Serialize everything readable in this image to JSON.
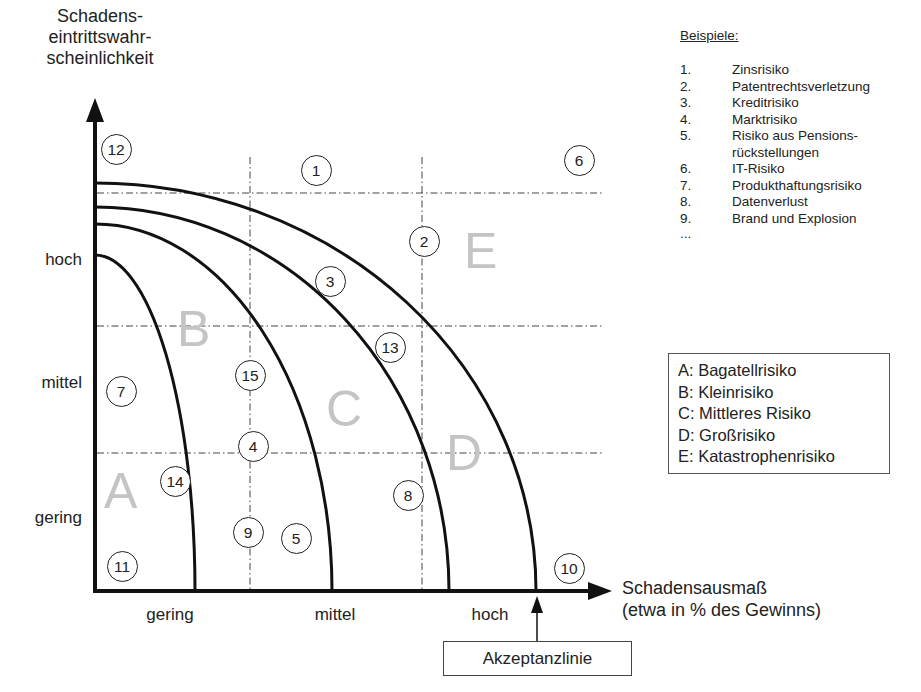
{
  "y_axis": {
    "title_lines": [
      "Schadens-",
      "eintrittswahr-",
      "scheinlichkeit"
    ],
    "ticks": [
      {
        "label": "hoch",
        "y": 260
      },
      {
        "label": "mittel",
        "y": 384
      },
      {
        "label": "gering",
        "y": 518
      }
    ]
  },
  "x_axis": {
    "title_lines": [
      "Schadensausmaß",
      "(etwa in % des Gewinns)"
    ],
    "ticks": [
      {
        "label": "gering",
        "x": 170
      },
      {
        "label": "mittel",
        "x": 335
      },
      {
        "label": "hoch",
        "x": 490
      }
    ]
  },
  "acceptance_line": {
    "label": "Akzeptanzlinie"
  },
  "examples": {
    "title": "Beispiele:",
    "items": [
      {
        "num": "1.",
        "label": "Zinsrisiko"
      },
      {
        "num": "2.",
        "label": "Patentrechtsverletzung"
      },
      {
        "num": "3.",
        "label": "Kreditrisiko"
      },
      {
        "num": "4.",
        "label": "Marktrisiko"
      },
      {
        "num": "5.",
        "label": "Risiko aus Pensions-"
      },
      {
        "num": "",
        "label": "rückstellungen"
      },
      {
        "num": "6.",
        "label": "IT-Risiko"
      },
      {
        "num": "7.",
        "label": "Produkthaftungsrisiko"
      },
      {
        "num": "8.",
        "label": "Datenverlust"
      },
      {
        "num": "9.",
        "label": "Brand und Explosion"
      }
    ],
    "ellipsis": "..."
  },
  "legend": {
    "items": [
      "A: Bagatellrisiko",
      "B: Kleinrisiko",
      "C: Mittleres Risiko",
      "D: Großrisiko",
      "E: Katastrophenrisiko"
    ]
  },
  "zones": [
    {
      "letter": "A",
      "x": 104,
      "y": 466
    },
    {
      "letter": "B",
      "x": 177,
      "y": 304
    },
    {
      "letter": "C",
      "x": 326,
      "y": 384
    },
    {
      "letter": "D",
      "x": 446,
      "y": 428
    },
    {
      "letter": "E",
      "x": 464,
      "y": 226
    }
  ],
  "markers": [
    {
      "label": "1",
      "cx": 316,
      "cy": 170
    },
    {
      "label": "2",
      "cx": 424,
      "cy": 241
    },
    {
      "label": "3",
      "cx": 330,
      "cy": 281
    },
    {
      "label": "4",
      "cx": 253,
      "cy": 446
    },
    {
      "label": "5",
      "cx": 296,
      "cy": 538
    },
    {
      "label": "6",
      "cx": 579,
      "cy": 160
    },
    {
      "label": "7",
      "cx": 121,
      "cy": 391
    },
    {
      "label": "8",
      "cx": 408,
      "cy": 495
    },
    {
      "label": "9",
      "cx": 248,
      "cy": 532
    },
    {
      "label": "10",
      "cx": 569,
      "cy": 568
    },
    {
      "label": "11",
      "cx": 122,
      "cy": 566
    },
    {
      "label": "12",
      "cx": 116,
      "cy": 149
    },
    {
      "label": "13",
      "cx": 390,
      "cy": 347
    },
    {
      "label": "14",
      "cx": 175,
      "cy": 481
    },
    {
      "label": "15",
      "cx": 250,
      "cy": 375
    }
  ],
  "curves": [
    {
      "name": "boundary-A-B",
      "y0": 255,
      "x1": 195
    },
    {
      "name": "boundary-B-C",
      "y0": 224,
      "x1": 332
    },
    {
      "name": "boundary-C-D",
      "y0": 207,
      "x1": 449
    },
    {
      "name": "boundary-D-E",
      "y0": 183,
      "x1": 536
    }
  ],
  "grid": {
    "horizontal_y": [
      193,
      326,
      453
    ],
    "vertical_x": [
      250,
      422
    ]
  }
}
